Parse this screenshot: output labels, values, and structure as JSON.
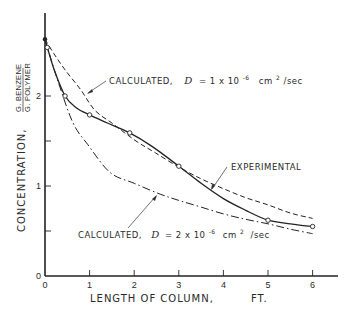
{
  "chart_data": {
    "type": "line",
    "title": "",
    "xlabel": "LENGTH OF COLUMN,",
    "xunit": "FT.",
    "ylabel": "CONCENTRATION,",
    "yunit_numerator": "G. BENZENE",
    "yunit_denominator": "G. POLYMER",
    "xlim": [
      0,
      6.5
    ],
    "ylim": [
      0,
      2.8
    ],
    "x_ticks": [
      0,
      1,
      2,
      3,
      4,
      5,
      6
    ],
    "x_tick_labels": [
      "0",
      "1",
      "2",
      "3",
      "4",
      "5",
      "6"
    ],
    "y_ticks": [
      0,
      0.5,
      1,
      1.5,
      2
    ],
    "y_tick_labels": [
      "0",
      "",
      "1",
      "",
      "2"
    ],
    "grid": false,
    "series": [
      {
        "name": "EXPERIMENTAL",
        "style": "solid",
        "markers": true,
        "x": [
          0.0,
          0.05,
          0.45,
          1.0,
          1.9,
          3.0,
          5.0,
          6.0
        ],
        "y": [
          2.63,
          2.54,
          2.0,
          1.79,
          1.59,
          1.22,
          0.62,
          0.55
        ],
        "marker_points": [
          [
            0.05,
            2.54
          ],
          [
            0.45,
            2.0
          ],
          [
            1.0,
            1.79
          ],
          [
            1.9,
            1.59
          ],
          [
            3.0,
            1.22
          ],
          [
            5.0,
            0.62
          ],
          [
            6.0,
            0.55
          ]
        ],
        "curve": [
          [
            0.0,
            2.63
          ],
          [
            0.2,
            2.3
          ],
          [
            0.45,
            2.0
          ],
          [
            0.7,
            1.87
          ],
          [
            1.0,
            1.79
          ],
          [
            1.4,
            1.7
          ],
          [
            1.9,
            1.59
          ],
          [
            2.4,
            1.44
          ],
          [
            3.0,
            1.22
          ],
          [
            3.5,
            1.03
          ],
          [
            4.0,
            0.86
          ],
          [
            4.5,
            0.73
          ],
          [
            5.0,
            0.62
          ],
          [
            5.5,
            0.58
          ],
          [
            6.0,
            0.55
          ]
        ]
      },
      {
        "name": "CALCULATED, D = 1 x 10^-6 cm^2/sec",
        "style": "dashed",
        "markers": false,
        "curve": [
          [
            0.0,
            2.63
          ],
          [
            0.2,
            2.47
          ],
          [
            0.45,
            2.29
          ],
          [
            0.8,
            2.07
          ],
          [
            1.12,
            1.84
          ],
          [
            1.5,
            1.7
          ],
          [
            1.79,
            1.59
          ],
          [
            2.1,
            1.48
          ],
          [
            2.47,
            1.37
          ],
          [
            3.0,
            1.21
          ],
          [
            3.5,
            1.08
          ],
          [
            4.0,
            0.97
          ],
          [
            4.5,
            0.87
          ],
          [
            5.0,
            0.79
          ],
          [
            5.5,
            0.7
          ],
          [
            6.0,
            0.64
          ]
        ]
      },
      {
        "name": "CALCULATED, D = 2 x 10^-6 cm^2/sec",
        "style": "dashdot",
        "markers": false,
        "curve": [
          [
            0.0,
            2.63
          ],
          [
            0.3,
            2.15
          ],
          [
            0.63,
            1.7
          ],
          [
            0.96,
            1.46
          ],
          [
            1.46,
            1.15
          ],
          [
            2.0,
            1.03
          ],
          [
            2.58,
            0.91
          ],
          [
            3.0,
            0.84
          ],
          [
            3.47,
            0.77
          ],
          [
            4.0,
            0.69
          ],
          [
            4.5,
            0.63
          ],
          [
            5.0,
            0.58
          ],
          [
            5.5,
            0.52
          ],
          [
            6.0,
            0.47
          ]
        ]
      }
    ],
    "annotations": [
      {
        "text_prefix": "CALCULATED,",
        "symbol": "D",
        "text_value": "= 1 x 10",
        "exponent": "-6",
        "units_base": "cm",
        "units_exp": "2",
        "units_tail": "/sec",
        "target_series": 1
      },
      {
        "text": "EXPERIMENTAL",
        "target_series": 0
      },
      {
        "text_prefix": "CALCULATED,",
        "symbol": "D",
        "text_value": "= 2 x 10",
        "exponent": "-6",
        "units_base": "cm",
        "units_exp": "2",
        "units_tail": "/sec",
        "target_series": 2
      }
    ]
  }
}
